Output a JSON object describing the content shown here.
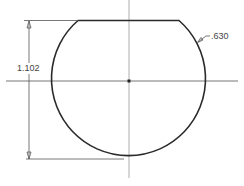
{
  "drawing": {
    "type": "truncated circle profile with dimensions",
    "dimensions": {
      "overall_height": "1.102",
      "radius": ".630"
    },
    "colors": {
      "background": "#ffffff",
      "profile_line": "#2a2a2a",
      "center_line": "#777777",
      "dimension_line": "#555555",
      "text": "#444444"
    }
  }
}
